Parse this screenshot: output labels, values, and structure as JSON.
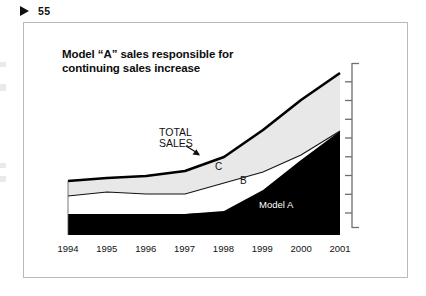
{
  "page": {
    "marker_icon": "play-triangle-icon",
    "number": "55"
  },
  "chart_title": "Model “A” sales responsible for continuing sales increase",
  "annotations": {
    "total_sales_line1": "TOTAL",
    "total_sales_line2": "SALES",
    "band_c": "C",
    "band_b": "B",
    "band_a": "Model A"
  },
  "colors": {
    "band_a_fill": "#000000",
    "band_b_fill": "#ffffff",
    "band_c_fill": "#e8e8e8",
    "outline": "#000000",
    "frame_border": "#b9b9b9",
    "text": "#111111",
    "label_on_black": "#ffffff"
  },
  "chart_data": {
    "type": "area",
    "stacked": true,
    "title": "Model “A” sales responsible for continuing sales increase",
    "xlabel": "",
    "ylabel": "",
    "grid": false,
    "legend_position": "inline-annotations",
    "axis": {
      "y_axis_side": "right",
      "y_tick_count": 9,
      "y_tick_labels": [],
      "x_tick_labels": [
        "1994",
        "1995",
        "1996",
        "1997",
        "1998",
        "1999",
        "2000",
        "2001"
      ]
    },
    "categories": [
      "1994",
      "1995",
      "1996",
      "1997",
      "1998",
      "1999",
      "2000",
      "2001"
    ],
    "series": [
      {
        "name": "Model A",
        "label": "Model A",
        "values": [
          21,
          21,
          21,
          21,
          24,
          38,
          57,
          82
        ]
      },
      {
        "name": "B",
        "label": "B",
        "values": [
          14,
          17,
          15,
          15,
          21,
          27,
          31,
          34
        ]
      },
      {
        "name": "C",
        "label": "C",
        "values": [
          29,
          28,
          30,
          32,
          33,
          34,
          34,
          36
        ]
      }
    ],
    "total_series": {
      "name": "TOTAL SALES",
      "values": [
        64,
        66,
        66,
        68,
        78,
        99,
        122,
        152
      ]
    },
    "ylim": [
      0,
      165
    ]
  }
}
